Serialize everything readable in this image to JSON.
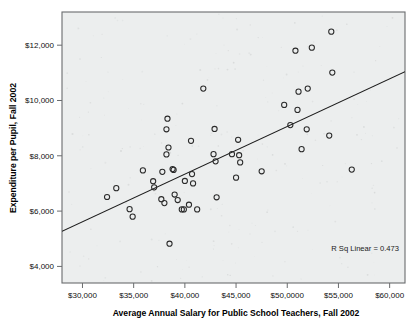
{
  "chart_data": {
    "type": "scatter",
    "title": "",
    "subtitle": "",
    "xlabel": "Average Annual Salary for Public School Teachers, Fall 2002",
    "ylabel": "Expenditure per Pupil, Fall 2002",
    "xlim": [
      28000,
      61500
    ],
    "ylim": [
      3400,
      13200
    ],
    "grid": false,
    "legend": "none",
    "xticks": [
      30000,
      35000,
      40000,
      45000,
      50000,
      55000,
      60000
    ],
    "xticklabels": [
      "$30,000",
      "$35,000",
      "$40,000",
      "$45,000",
      "$50,0000",
      "$55,000",
      "$60,000"
    ],
    "yticks": [
      4000,
      6000,
      8000,
      10000,
      12000
    ],
    "yticklabels": [
      "$4,000",
      "$6,000",
      "$8,000",
      "$10,000",
      "$12,000"
    ],
    "annotations": [
      {
        "text": "R Sq Linear = 0.473",
        "x": 56500,
        "y": 4950
      }
    ],
    "trendline": {
      "type": "linear",
      "r_squared": 0.473,
      "x_start": 28000,
      "y_start": 5270,
      "x_end": 61500,
      "y_end": 11040
    },
    "series": [
      {
        "name": "States",
        "marker": "open-circle",
        "points": [
          {
            "x": 32400,
            "y": 6510
          },
          {
            "x": 33300,
            "y": 6830
          },
          {
            "x": 34600,
            "y": 6070
          },
          {
            "x": 34900,
            "y": 5800
          },
          {
            "x": 35900,
            "y": 7470
          },
          {
            "x": 36900,
            "y": 7080
          },
          {
            "x": 37000,
            "y": 6860
          },
          {
            "x": 37700,
            "y": 6430
          },
          {
            "x": 37800,
            "y": 7420
          },
          {
            "x": 38000,
            "y": 6290
          },
          {
            "x": 38200,
            "y": 8050
          },
          {
            "x": 38200,
            "y": 8960
          },
          {
            "x": 38300,
            "y": 9340
          },
          {
            "x": 38400,
            "y": 8300
          },
          {
            "x": 38500,
            "y": 4820
          },
          {
            "x": 38800,
            "y": 7520
          },
          {
            "x": 38900,
            "y": 7490
          },
          {
            "x": 39000,
            "y": 6600
          },
          {
            "x": 39300,
            "y": 6400
          },
          {
            "x": 39700,
            "y": 6060
          },
          {
            "x": 39900,
            "y": 6060
          },
          {
            "x": 40000,
            "y": 7090
          },
          {
            "x": 40400,
            "y": 6230
          },
          {
            "x": 40600,
            "y": 8540
          },
          {
            "x": 40700,
            "y": 7340
          },
          {
            "x": 40800,
            "y": 7000
          },
          {
            "x": 41200,
            "y": 6060
          },
          {
            "x": 41800,
            "y": 10430
          },
          {
            "x": 42800,
            "y": 8060
          },
          {
            "x": 42900,
            "y": 8970
          },
          {
            "x": 43000,
            "y": 7800
          },
          {
            "x": 43100,
            "y": 6500
          },
          {
            "x": 44600,
            "y": 8060
          },
          {
            "x": 45000,
            "y": 7210
          },
          {
            "x": 45200,
            "y": 8580
          },
          {
            "x": 45300,
            "y": 8020
          },
          {
            "x": 45400,
            "y": 7760
          },
          {
            "x": 47500,
            "y": 7440
          },
          {
            "x": 49700,
            "y": 9840
          },
          {
            "x": 50300,
            "y": 9110
          },
          {
            "x": 50800,
            "y": 11800
          },
          {
            "x": 51000,
            "y": 9660
          },
          {
            "x": 51100,
            "y": 10320
          },
          {
            "x": 51400,
            "y": 8240
          },
          {
            "x": 51900,
            "y": 8960
          },
          {
            "x": 52000,
            "y": 10430
          },
          {
            "x": 52400,
            "y": 11910
          },
          {
            "x": 54100,
            "y": 8730
          },
          {
            "x": 54300,
            "y": 12490
          },
          {
            "x": 54400,
            "y": 11010
          },
          {
            "x": 56300,
            "y": 7500
          }
        ]
      }
    ]
  },
  "figure": {
    "background_color": "#ffffff",
    "plot_area_color": "#eceeee",
    "axis_color": "#6a6c6e",
    "marker_color": "#2a2a2a",
    "line_color": "#1c1c1c"
  }
}
